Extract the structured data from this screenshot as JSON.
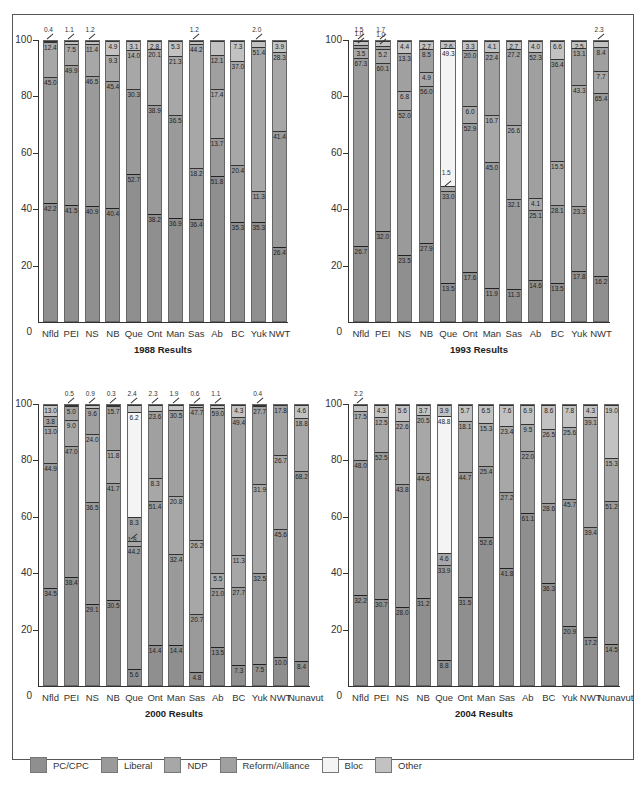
{
  "figure": {
    "caption_partial": "Figure: Federal Election Results by Province and Territory, 1988–2004"
  },
  "legend": [
    {
      "key": "pc",
      "label": "PC/CPC",
      "color": "#8f8f8f"
    },
    {
      "key": "lib",
      "label": "Liberal",
      "color": "#9a9a9a"
    },
    {
      "key": "ndp",
      "label": "NDP",
      "color": "#a7a7a7"
    },
    {
      "key": "ref",
      "label": "Reform/Alliance",
      "color": "#a0a0a0"
    },
    {
      "key": "bloc",
      "label": "Bloc",
      "color": "#f4f4f4"
    },
    {
      "key": "oth",
      "label": "Other",
      "color": "#c2c2c2"
    }
  ],
  "chart_data": [
    {
      "type": "bar",
      "stacked": true,
      "title": "1988 Results",
      "xlabel": "",
      "ylabel": "",
      "ylim": [
        0,
        100
      ],
      "yticks": [
        0,
        20,
        40,
        60,
        80,
        100
      ],
      "categories": [
        "Nfld",
        "PEI",
        "NS",
        "NB",
        "Que",
        "Ont",
        "Man",
        "Sas",
        "Ab",
        "BC",
        "Yuk",
        "NWT"
      ],
      "series": [
        {
          "name": "PC/CPC",
          "values": [
            42.2,
            41.5,
            40.9,
            40.4,
            52.7,
            38.2,
            36.9,
            36.4,
            51.8,
            35.3,
            35.3,
            26.4
          ]
        },
        {
          "name": "Liberal",
          "values": [
            45.0,
            49.9,
            46.5,
            45.4,
            30.3,
            38.9,
            36.5,
            18.2,
            13.7,
            20.4,
            11.3,
            41.4
          ]
        },
        {
          "name": "NDP",
          "values": [
            12.4,
            7.5,
            11.4,
            9.3,
            14.0,
            20.1,
            21.3,
            44.2,
            17.4,
            37.0,
            51.4,
            28.3
          ]
        },
        {
          "name": "Reform/Alliance",
          "values": [
            0,
            0,
            0,
            0,
            0,
            0,
            0,
            0,
            12.1,
            0,
            0,
            0
          ]
        },
        {
          "name": "Bloc",
          "values": [
            0,
            0,
            0,
            0,
            0,
            0,
            0,
            0,
            0,
            0,
            0,
            0
          ]
        },
        {
          "name": "Other",
          "values": [
            0.4,
            1.1,
            1.2,
            4.9,
            3.1,
            2.8,
            5.3,
            1.2,
            5.0,
            7.3,
            2.0,
            3.9
          ]
        }
      ],
      "labels": [
        {
          "pc": "42.2",
          "lib": "45.0",
          "ndp": "12.4",
          "oth_callout": "0.4"
        },
        {
          "pc": "41.5",
          "lib": "49.9",
          "ndp": "7.5",
          "oth_callout": "1.1"
        },
        {
          "pc": "40.9",
          "lib": "46.5",
          "ndp": "11.4",
          "oth_callout": "1.2"
        },
        {
          "pc": "40.4",
          "lib": "45.4",
          "ndp": "9.3",
          "oth": "4.9"
        },
        {
          "pc": "52.7",
          "lib": "30.3",
          "ndp": "14.0",
          "oth": "3.1"
        },
        {
          "pc": "38.2",
          "lib": "38.9",
          "ndp": "20.1",
          "oth": "2.8"
        },
        {
          "pc": "36.9",
          "lib": "36.5",
          "ndp": "21.3",
          "oth": "5.3"
        },
        {
          "pc": "36.4",
          "lib": "18.2",
          "ndp": "44.2",
          "oth_callout": "1.2"
        },
        {
          "pc": "51.8",
          "lib": "13.7",
          "ndp": "17.4",
          "ref": "12.1"
        },
        {
          "pc": "35.3",
          "lib": "20.4",
          "ndp": "37.0",
          "oth": "7.3"
        },
        {
          "pc": "35.3",
          "lib": "11.3",
          "ndp": "51.4",
          "oth_callout": "2.0"
        },
        {
          "pc": "26.4",
          "lib": "41.4",
          "ndp": "28.3",
          "oth": "3.9"
        }
      ]
    },
    {
      "type": "bar",
      "stacked": true,
      "title": "1993 Results",
      "ylim": [
        0,
        100
      ],
      "yticks": [
        0,
        20,
        40,
        60,
        80,
        100
      ],
      "categories": [
        "Nfld",
        "PEI",
        "NS",
        "NB",
        "Que",
        "Ont",
        "Man",
        "Sas",
        "Ab",
        "BC",
        "Yuk",
        "NWT"
      ],
      "series": [
        {
          "name": "PC/CPC",
          "values": [
            26.7,
            32.0,
            23.5,
            27.9,
            13.5,
            17.6,
            11.9,
            11.3,
            14.6,
            13.5,
            17.8,
            16.2
          ]
        },
        {
          "name": "Liberal",
          "values": [
            67.3,
            60.1,
            52.0,
            56.0,
            33.0,
            52.9,
            45.0,
            32.1,
            25.1,
            28.1,
            23.3,
            65.4
          ]
        },
        {
          "name": "NDP",
          "values": [
            3.5,
            5.2,
            6.8,
            4.9,
            1.5,
            6.0,
            16.7,
            26.6,
            4.1,
            15.5,
            43.3,
            7.7
          ]
        },
        {
          "name": "Reform/Alliance",
          "values": [
            1.0,
            1.0,
            13.3,
            8.5,
            0,
            20.0,
            22.4,
            27.2,
            52.3,
            36.4,
            13.1,
            8.4
          ]
        },
        {
          "name": "Bloc",
          "values": [
            0,
            0,
            0,
            0,
            49.3,
            0,
            0,
            0,
            0,
            0,
            0,
            0
          ]
        },
        {
          "name": "Other",
          "values": [
            1.5,
            1.7,
            4.4,
            2.7,
            2.6,
            3.3,
            4.1,
            2.7,
            4.0,
            6.6,
            2.5,
            2.3
          ]
        }
      ],
      "labels": [
        {
          "pc": "26.7",
          "lib": "67.3",
          "ndp": "3.5",
          "ref_callout": "1.0",
          "oth_callout": "1.5"
        },
        {
          "pc": "32.0",
          "lib": "60.1",
          "ndp": "5.2",
          "ref_callout": "1.0",
          "oth_callout": "1.7"
        },
        {
          "pc": "23.5",
          "lib": "52.0",
          "ndp": "6.8",
          "ref": "13.3",
          "oth": "4.4"
        },
        {
          "pc": "27.9",
          "lib": "56.0",
          "ndp": "4.9",
          "ref": "8.5",
          "oth": "2.7"
        },
        {
          "pc": "13.5",
          "lib": "33.0",
          "ndp_callout": "1.5",
          "bloc": "49.3",
          "oth": "2.6"
        },
        {
          "pc": "17.6",
          "lib": "52.9",
          "ndp": "6.0",
          "ref": "20.0",
          "oth": "3.3"
        },
        {
          "pc": "11.9",
          "lib": "45.0",
          "ndp": "16.7",
          "ref": "22.4",
          "oth": "4.1"
        },
        {
          "pc": "11.3",
          "lib": "32.1",
          "ndp": "26.6",
          "ref": "27.2",
          "oth": "2.7"
        },
        {
          "pc": "14.6",
          "lib": "25.1",
          "ndp": "4.1",
          "ref": "52.3",
          "oth": "4.0"
        },
        {
          "pc": "13.5",
          "lib": "28.1",
          "ndp": "15.5",
          "ref": "36.4",
          "oth": "6.6"
        },
        {
          "pc": "17.8",
          "lib": "23.3",
          "ndp": "43.3",
          "ref": "13.1",
          "oth": "2.5"
        },
        {
          "pc": "16.2",
          "lib": "65.4",
          "ndp": "7.7",
          "ref": "8.4",
          "oth_callout": "2.3"
        }
      ]
    },
    {
      "type": "bar",
      "stacked": true,
      "title": "2000 Results",
      "ylim": [
        0,
        100
      ],
      "yticks": [
        0,
        20,
        40,
        60,
        80,
        100
      ],
      "categories": [
        "Nfld",
        "PEI",
        "NS",
        "NB",
        "Que",
        "Ont",
        "Man",
        "Sas",
        "Ab",
        "BC",
        "Yuk",
        "NWT",
        "Nunavut"
      ],
      "series": [
        {
          "name": "PC/CPC",
          "values": [
            34.5,
            38.4,
            29.1,
            30.5,
            5.6,
            14.4,
            14.4,
            4.8,
            13.5,
            7.3,
            7.5,
            10.0,
            8.4
          ]
        },
        {
          "name": "Liberal",
          "values": [
            44.9,
            47.0,
            36.5,
            41.7,
            44.2,
            51.4,
            32.4,
            20.7,
            21.0,
            27.7,
            32.5,
            45.6,
            68.2
          ]
        },
        {
          "name": "NDP",
          "values": [
            13.0,
            9.0,
            24.0,
            11.8,
            1.8,
            8.3,
            20.8,
            26.2,
            5.5,
            11.3,
            31.9,
            26.7,
            18.8
          ]
        },
        {
          "name": "Reform/Alliance",
          "values": [
            3.8,
            5.0,
            9.6,
            15.7,
            8.3,
            23.6,
            30.5,
            47.7,
            59.0,
            49.4,
            27.7,
            17.8,
            0
          ]
        },
        {
          "name": "Bloc",
          "values": [
            0,
            0,
            0,
            0,
            37.7,
            0,
            0,
            0,
            0,
            0,
            0,
            0,
            0
          ]
        },
        {
          "name": "Other",
          "values": [
            3.8,
            0.5,
            0.9,
            0.3,
            2.4,
            2.3,
            1.9,
            0.6,
            1.1,
            4.3,
            0.4,
            0,
            4.6
          ]
        }
      ],
      "labels": [
        {
          "pc": "34.5",
          "lib": "44.9",
          "ndp": "13.0",
          "ref": "3.8",
          "oth": "13.0"
        },
        {
          "pc": "38.4",
          "lib": "47.0",
          "ndp": "9.0",
          "ref": "5.0",
          "oth_callout": "0.5"
        },
        {
          "pc": "29.1",
          "lib": "36.5",
          "ndp": "24.0",
          "ref": "9.6",
          "oth_callout": "0.9"
        },
        {
          "pc": "30.5",
          "lib": "41.7",
          "ndp": "11.8",
          "ref": "15.7",
          "oth_callout": "0.3"
        },
        {
          "pc": "5.6",
          "lib": "44.2",
          "ndp_callout": "1.8",
          "ref": "8.3",
          "bloc": "6.2",
          "oth_callout": "2.4"
        },
        {
          "pc": "14.4",
          "lib": "51.4",
          "ndp": "8.3",
          "ref": "23.6",
          "oth_callout": "2.3"
        },
        {
          "pc": "14.4",
          "lib": "32.4",
          "ndp": "20.8",
          "ref": "30.5",
          "oth_callout": "1.9"
        },
        {
          "pc": "4.8",
          "lib": "20.7",
          "ndp": "26.2",
          "ref": "47.7",
          "oth_callout": "0.6"
        },
        {
          "pc": "13.5",
          "lib": "21.0",
          "ndp": "5.5",
          "ref": "59.0",
          "oth_callout": "1.1"
        },
        {
          "pc": "7.3",
          "lib": "27.7",
          "ndp": "11.3",
          "ref": "49.4",
          "oth": "4.3"
        },
        {
          "pc": "7.5",
          "lib": "32.5",
          "ndp": "31.9",
          "ref": "27.7",
          "oth_callout": "0.4"
        },
        {
          "pc": "10.0",
          "lib": "45.6",
          "ndp": "26.7",
          "ref": "17.8",
          "oth_callout": "0"
        },
        {
          "pc": "8.4",
          "lib": "68.2",
          "ndp": "18.8",
          "oth": "4.6"
        }
      ]
    },
    {
      "type": "bar",
      "stacked": true,
      "title": "2004 Results",
      "ylim": [
        0,
        100
      ],
      "yticks": [
        0,
        20,
        40,
        60,
        80,
        100
      ],
      "categories": [
        "Nfld",
        "PEI",
        "NS",
        "NB",
        "Que",
        "Ont",
        "Man",
        "Sas",
        "Ab",
        "BC",
        "Yuk",
        "NWT",
        "Nunavut"
      ],
      "series": [
        {
          "name": "PC/CPC",
          "values": [
            32.2,
            30.7,
            28.0,
            31.2,
            8.8,
            31.5,
            52.6,
            41.8,
            61.1,
            36.3,
            20.9,
            17.2,
            14.5
          ]
        },
        {
          "name": "Liberal",
          "values": [
            48.0,
            52.5,
            43.8,
            44.6,
            33.9,
            44.7,
            25.4,
            27.2,
            22.0,
            28.6,
            45.7,
            39.4,
            51.2
          ]
        },
        {
          "name": "NDP",
          "values": [
            17.5,
            12.5,
            22.6,
            20.5,
            4.6,
            18.1,
            15.3,
            23.4,
            9.5,
            26.5,
            25.6,
            39.1,
            15.3
          ]
        },
        {
          "name": "Reform/Alliance",
          "values": [
            0,
            0,
            0,
            0,
            0,
            0,
            0,
            0,
            0,
            0,
            0,
            0,
            0
          ]
        },
        {
          "name": "Bloc",
          "values": [
            0,
            0,
            0,
            0,
            48.8,
            0,
            0,
            0,
            0,
            0,
            0,
            0,
            0
          ]
        },
        {
          "name": "Other",
          "values": [
            2.2,
            4.3,
            5.6,
            3.7,
            3.9,
            5.7,
            6.5,
            7.6,
            6.9,
            8.6,
            7.8,
            4.3,
            19.0
          ]
        }
      ],
      "labels": [
        {
          "pc": "32.2",
          "lib": "48.0",
          "ndp": "17.5",
          "oth_callout": "2.2"
        },
        {
          "pc": "30.7",
          "lib": "52.5",
          "ndp": "12.5",
          "oth": "4.3"
        },
        {
          "pc": "28.0",
          "lib": "43.8",
          "ndp": "22.6",
          "oth": "5.6"
        },
        {
          "pc": "31.2",
          "lib": "44.6",
          "ndp": "20.5",
          "oth": "3.7"
        },
        {
          "pc": "8.8",
          "lib": "33.9",
          "ndp": "4.6",
          "bloc": "48.8",
          "oth": "3.9"
        },
        {
          "pc": "31.5",
          "lib": "44.7",
          "ndp": "18.1",
          "oth": "5.7"
        },
        {
          "pc": "52.6",
          "lib": "25.4",
          "ndp": "15.3",
          "oth": "6.5"
        },
        {
          "pc": "41.8",
          "lib": "27.2",
          "ndp": "23.4",
          "oth": "7.6"
        },
        {
          "pc": "61.1",
          "lib": "22.0",
          "ndp": "9.5",
          "oth": "6.9"
        },
        {
          "pc": "36.3",
          "lib": "28.6",
          "ndp": "26.5",
          "oth": "8.6"
        },
        {
          "pc": "20.9",
          "lib": "45.7",
          "ndp": "25.6",
          "oth": "7.8"
        },
        {
          "pc": "17.2",
          "lib": "39.4",
          "ndp": "39.1",
          "oth": "4.3"
        },
        {
          "pc": "14.5",
          "lib": "51.2",
          "ndp": "15.3",
          "oth": "19.0"
        }
      ]
    }
  ]
}
